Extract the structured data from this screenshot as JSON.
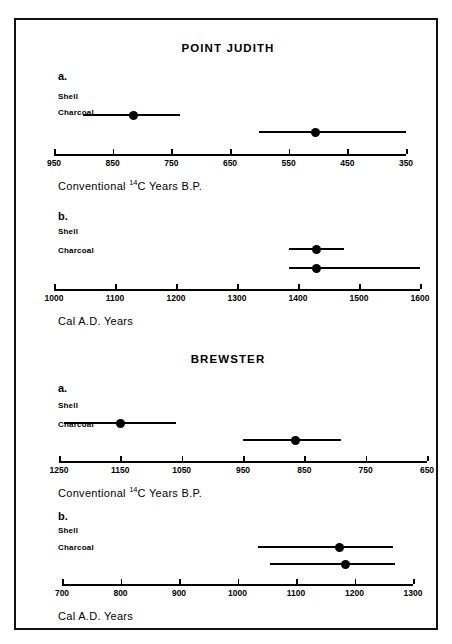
{
  "caption": {
    "text": "charcoal dates."
  },
  "figure": {
    "groups": [
      {
        "title": "POINT JUDITH",
        "panels": [
          {
            "letter": "a.",
            "axis_title_prefix": "Conventional ",
            "axis_title_sup": "14",
            "axis_title_suffix": "C Years B.P.",
            "axis_label_plain": "Conventional 14C Years B.P.",
            "ticks": [
              "950",
              "850",
              "750",
              "650",
              "550",
              "450",
              "350"
            ],
            "rows": [
              {
                "label": "Shell"
              },
              {
                "label": "Charcoal"
              }
            ]
          },
          {
            "letter": "b.",
            "axis_title_prefix": "Cal A.D. Years",
            "axis_title_sup": "",
            "axis_title_suffix": "",
            "axis_label_plain": "Cal A.D. Years",
            "ticks": [
              "1000",
              "1100",
              "1200",
              "1300",
              "1400",
              "1500",
              "1600"
            ],
            "rows": [
              {
                "label": "Shell"
              },
              {
                "label": "Charcoal"
              }
            ]
          }
        ]
      },
      {
        "title": "BREWSTER",
        "panels": [
          {
            "letter": "a.",
            "axis_title_prefix": "Conventional ",
            "axis_title_sup": "14",
            "axis_title_suffix": "C Years B.P.",
            "axis_label_plain": "Conventional 14C Years B.P.",
            "ticks": [
              "1250",
              "1150",
              "1050",
              "950",
              "850",
              "750",
              "650"
            ],
            "rows": [
              {
                "label": "Shell"
              },
              {
                "label": "Charcoal"
              }
            ]
          },
          {
            "letter": "b.",
            "axis_title_prefix": "Cal A.D. Years",
            "axis_title_sup": "",
            "axis_title_suffix": "",
            "axis_label_plain": "Cal A.D. Years",
            "ticks": [
              "700",
              "800",
              "900",
              "1000",
              "1100",
              "1200",
              "1300"
            ],
            "rows": [
              {
                "label": "Shell"
              },
              {
                "label": "Charcoal"
              }
            ]
          }
        ]
      }
    ]
  },
  "colors": {
    "ink": "#000000",
    "frame": "#111111",
    "background": "#ffffff"
  },
  "chart_data": [
    {
      "type": "range",
      "id": "point-judith-conventional",
      "title": "POINT JUDITH",
      "panel": "a",
      "xlabel": "Conventional 14C Years B.P.",
      "axis_reversed": true,
      "xlim": [
        950,
        350
      ],
      "ticks": [
        950,
        850,
        750,
        650,
        550,
        450,
        350
      ],
      "categories": [
        "Shell",
        "Charcoal"
      ],
      "series": [
        {
          "name": "Shell",
          "value": 815,
          "low": 900,
          "high": 735
        },
        {
          "name": "Charcoal",
          "value": 505,
          "low": 600,
          "high": 350
        }
      ]
    },
    {
      "type": "range",
      "id": "point-judith-calibrated",
      "title": "POINT JUDITH",
      "panel": "b",
      "xlabel": "Cal A.D. Years",
      "axis_reversed": false,
      "xlim": [
        1000,
        1600
      ],
      "ticks": [
        1000,
        1100,
        1200,
        1300,
        1400,
        1500,
        1600
      ],
      "categories": [
        "Shell",
        "Charcoal"
      ],
      "series": [
        {
          "name": "Shell",
          "value": 1430,
          "low": 1385,
          "high": 1475
        },
        {
          "name": "Charcoal",
          "value": 1430,
          "low": 1385,
          "high": 1600
        }
      ]
    },
    {
      "type": "range",
      "id": "brewster-conventional",
      "title": "BREWSTER",
      "panel": "a",
      "xlabel": "Conventional 14C Years B.P.",
      "axis_reversed": true,
      "xlim": [
        1250,
        650
      ],
      "ticks": [
        1250,
        1150,
        1050,
        950,
        850,
        750,
        650
      ],
      "categories": [
        "Shell",
        "Charcoal"
      ],
      "series": [
        {
          "name": "Shell",
          "value": 1150,
          "low": 1242,
          "high": 1060
        },
        {
          "name": "Charcoal",
          "value": 865,
          "low": 950,
          "high": 790
        }
      ]
    },
    {
      "type": "range",
      "id": "brewster-calibrated",
      "title": "BREWSTER",
      "panel": "b",
      "xlabel": "Cal A.D. Years",
      "axis_reversed": false,
      "xlim": [
        700,
        1300
      ],
      "ticks": [
        700,
        800,
        900,
        1000,
        1100,
        1200,
        1300
      ],
      "categories": [
        "Shell",
        "Charcoal"
      ],
      "series": [
        {
          "name": "Shell",
          "value": 1175,
          "low": 1035,
          "high": 1265
        },
        {
          "name": "Charcoal",
          "value": 1185,
          "low": 1055,
          "high": 1270
        }
      ]
    }
  ]
}
